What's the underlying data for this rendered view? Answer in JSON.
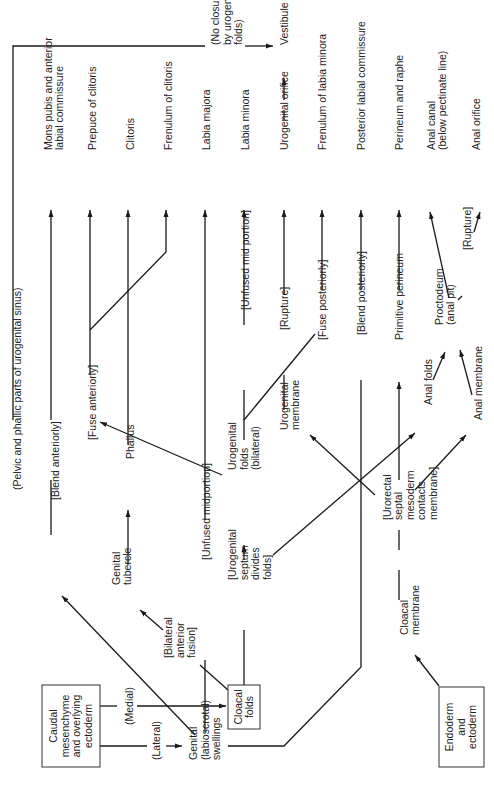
{
  "diagram": {
    "boxes": [
      {
        "id": "caudal",
        "x": 42,
        "y": 685,
        "w": 58,
        "h": 82,
        "lines": [
          "Caudal",
          "mesenchyme",
          "and overlying",
          "ectoderm"
        ],
        "cx": 71,
        "cy": 726
      },
      {
        "id": "cloacal-folds",
        "x": 228,
        "y": 685,
        "w": 32,
        "h": 44,
        "lines": [
          "Cloacal",
          "folds"
        ],
        "cx": 244,
        "cy": 707
      },
      {
        "id": "endoderm",
        "x": 439,
        "y": 687,
        "w": 45,
        "h": 80,
        "lines": [
          "Endoderm",
          "and",
          "ectoderm"
        ],
        "cx": 461,
        "cy": 727
      }
    ],
    "labels": [
      {
        "id": "pelvic-phallic",
        "x": 17,
        "y": 490,
        "lines": [
          "(Pelvic and phallic parts of urogenital sinus)"
        ]
      },
      {
        "id": "blend-anteriorly",
        "x": 55,
        "y": 500,
        "lines": [
          "[Blend anteriorly]"
        ]
      },
      {
        "id": "mons-pubis",
        "x": 54,
        "y": 150,
        "lines": [
          "Mons pubis and anterior",
          "labial commissure"
        ]
      },
      {
        "id": "prepuce",
        "x": 92,
        "y": 150,
        "lines": [
          "Prepuce of clitoris"
        ]
      },
      {
        "id": "fuse-anteriorly",
        "x": 92,
        "y": 440,
        "lines": [
          "[Fuse anteriorly]"
        ]
      },
      {
        "id": "clitoris",
        "x": 130,
        "y": 150,
        "lines": [
          "Clitoris"
        ]
      },
      {
        "id": "phallus",
        "x": 130,
        "y": 459,
        "lines": [
          "Phallus"
        ]
      },
      {
        "id": "genital-tubercle",
        "x": 122,
        "y": 585,
        "lines": [
          "Genital",
          "tubercle"
        ]
      },
      {
        "id": "frenulum-clitoris",
        "x": 168,
        "y": 150,
        "lines": [
          "Frenulum of clitoris"
        ]
      },
      {
        "id": "bilateral-anterior-fusion",
        "x": 180,
        "y": 658,
        "lines": [
          "[Bilateral",
          "anterior",
          "fusion]"
        ]
      },
      {
        "id": "labia-majora",
        "x": 206,
        "y": 150,
        "lines": [
          "Labia majora"
        ]
      },
      {
        "id": "unfused-midportion",
        "x": 206,
        "y": 560,
        "lines": [
          "[Unfused midportion]"
        ]
      },
      {
        "id": "labia-minora",
        "x": 245,
        "y": 150,
        "lines": [
          "Labia minora"
        ]
      },
      {
        "id": "unfused-mid-portion",
        "x": 245,
        "y": 310,
        "lines": [
          "[Unfused mid portion]"
        ]
      },
      {
        "id": "urogenital-folds",
        "x": 244,
        "y": 470,
        "lines": [
          "Urogenital",
          "folds",
          "(bilateral)"
        ]
      },
      {
        "id": "urogenital-septum",
        "x": 250,
        "y": 580,
        "lines": [
          "[Urogenital",
          "septum",
          "divides",
          "folds]"
        ]
      },
      {
        "id": "no-closure",
        "x": 227,
        "y": 45,
        "lines": [
          "(No closure",
          "by urogenital",
          "folds)"
        ]
      },
      {
        "id": "vestibule",
        "x": 284,
        "y": 45,
        "lines": [
          "Vestibule"
        ]
      },
      {
        "id": "urogenital-orifice",
        "x": 284,
        "y": 150,
        "lines": [
          "Urogenital orifice"
        ]
      },
      {
        "id": "rupture-1",
        "x": 284,
        "y": 330,
        "lines": [
          "[Rupture]"
        ]
      },
      {
        "id": "urogenital-membrane",
        "x": 290,
        "y": 430,
        "lines": [
          "Urogenital",
          "membrane"
        ]
      },
      {
        "id": "frenulum-labia-minora",
        "x": 322,
        "y": 150,
        "lines": [
          "Frenulum of labia minora"
        ]
      },
      {
        "id": "fuse-posteriorly",
        "x": 322,
        "y": 340,
        "lines": [
          "[Fuse posteriorly]"
        ]
      },
      {
        "id": "posterior-labial-commissure",
        "x": 361,
        "y": 150,
        "lines": [
          "Posterior labial commissure"
        ]
      },
      {
        "id": "blend-posteriorly",
        "x": 361,
        "y": 335,
        "lines": [
          "[Blend posteriorly]"
        ]
      },
      {
        "id": "perineum-raphe",
        "x": 399,
        "y": 150,
        "lines": [
          "Perineum and raphe"
        ]
      },
      {
        "id": "primitive-perineum",
        "x": 399,
        "y": 340,
        "lines": [
          "Primitive perineum"
        ]
      },
      {
        "id": "urorectal-septal",
        "x": 410,
        "y": 520,
        "lines": [
          "[Urorectal",
          "septal",
          "mesoderm",
          "contacts",
          "membrane]"
        ]
      },
      {
        "id": "cloacal-membrane",
        "x": 410,
        "y": 635,
        "lines": [
          "Cloacal",
          "membrane"
        ]
      },
      {
        "id": "anal-canal",
        "x": 437,
        "y": 150,
        "lines": [
          "Anal canal",
          "(below pectinate line)"
        ]
      },
      {
        "id": "proctodeum",
        "x": 445,
        "y": 325,
        "lines": [
          "Proctodeum",
          "(anal pit)"
        ]
      },
      {
        "id": "anal-folds",
        "x": 428,
        "y": 405,
        "lines": [
          "Anal folds"
        ]
      },
      {
        "id": "rupture-2",
        "x": 467,
        "y": 250,
        "lines": [
          "[Rupture]"
        ]
      },
      {
        "id": "anal-orifice",
        "x": 476,
        "y": 150,
        "lines": [
          "Anal orifice"
        ]
      },
      {
        "id": "anal-membrane",
        "x": 478,
        "y": 420,
        "lines": [
          "Anal membrane"
        ]
      },
      {
        "id": "medial",
        "x": 129,
        "y": 725,
        "lines": [
          "(Medial)"
        ]
      },
      {
        "id": "lateral",
        "x": 156,
        "y": 760,
        "lines": [
          "(Lateral)"
        ]
      },
      {
        "id": "genital-swellings",
        "x": 205,
        "y": 760,
        "lines": [
          "Genital",
          "(labioscrotal)",
          "swellings"
        ]
      }
    ]
  }
}
